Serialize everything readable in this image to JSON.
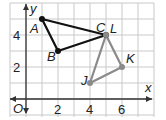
{
  "chart_data": {
    "type": "scatter",
    "title": "",
    "xlabel": "x",
    "ylabel": "y",
    "origin_label": "O",
    "xlim": [
      -1,
      7
    ],
    "ylim": [
      -1,
      5.5
    ],
    "grid": true,
    "x_ticks": [
      2,
      4,
      6
    ],
    "y_ticks": [
      2,
      4
    ],
    "x_tick_labels": [
      "2",
      "4",
      "6"
    ],
    "y_tick_labels": [
      "2",
      "4"
    ],
    "series": [
      {
        "name": "Triangle ABC",
        "color": "#111111",
        "points": [
          {
            "label": "A",
            "x": 1,
            "y": 5
          },
          {
            "label": "B",
            "x": 2,
            "y": 3
          },
          {
            "label": "C",
            "x": 5,
            "y": 4
          }
        ]
      },
      {
        "name": "Triangle JKL",
        "color": "#8a8a8a",
        "points": [
          {
            "label": "J",
            "x": 4,
            "y": 1
          },
          {
            "label": "K",
            "x": 6,
            "y": 2
          },
          {
            "label": "L",
            "x": 5,
            "y": 4
          }
        ]
      }
    ]
  }
}
